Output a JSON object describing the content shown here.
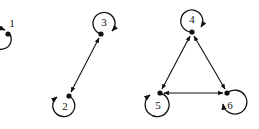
{
  "diagram": {
    "type": "directed-graph-with-self-loops",
    "nodes": [
      {
        "id": "1",
        "label": "1",
        "x": 8,
        "y": 34,
        "loop": {
          "cx": 12,
          "cy": 23,
          "r": 10
        },
        "label_pos": [
          12,
          27
        ]
      },
      {
        "id": "2",
        "label": "2",
        "x": 69,
        "y": 96,
        "loop": {
          "cx": 65,
          "cy": 106,
          "r": 11
        },
        "label_pos": [
          65,
          110
        ]
      },
      {
        "id": "3",
        "label": "3",
        "x": 101,
        "y": 34,
        "loop": {
          "cx": 104,
          "cy": 23,
          "r": 11
        },
        "label_pos": [
          104,
          26
        ]
      },
      {
        "id": "4",
        "label": "4",
        "x": 192,
        "y": 32,
        "loop": {
          "cx": 192,
          "cy": 20,
          "r": 11
        },
        "label_pos": [
          192,
          23
        ]
      },
      {
        "id": "5",
        "label": "5",
        "x": 160,
        "y": 93,
        "loop": {
          "cx": 157,
          "cy": 105,
          "r": 12
        },
        "label_pos": [
          158,
          109
        ]
      },
      {
        "id": "6",
        "label": "6",
        "x": 227,
        "y": 93,
        "loop": {
          "cx": 233,
          "cy": 105,
          "r": 12
        },
        "label_pos": [
          230,
          109
        ]
      }
    ],
    "edges": [
      {
        "from": "2",
        "to": "3",
        "bidirectional": true
      },
      {
        "from": "4",
        "to": "5",
        "bidirectional": true
      },
      {
        "from": "4",
        "to": "6",
        "bidirectional": true
      },
      {
        "from": "5",
        "to": "6",
        "bidirectional": true
      }
    ],
    "colors": {
      "stroke": "#111111",
      "background": "#ffffff"
    }
  }
}
